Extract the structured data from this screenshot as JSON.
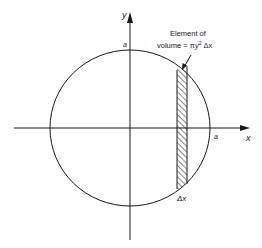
{
  "diagram": {
    "axes": {
      "x_label": "x",
      "y_label": "y"
    },
    "circle": {
      "radius_label_top": "a",
      "radius_label_right": "a"
    },
    "annotation": {
      "line1": "Element of",
      "line2_prefix": "volume = ",
      "line2_pi": "π",
      "line2_y": "y",
      "line2_exp": "2",
      "line2_suffix": " Δx"
    },
    "strip": {
      "width_label": "Δx",
      "fill": "hatched"
    },
    "colors": {
      "ink": "#1a1a1a",
      "background": "#ffffff"
    }
  }
}
